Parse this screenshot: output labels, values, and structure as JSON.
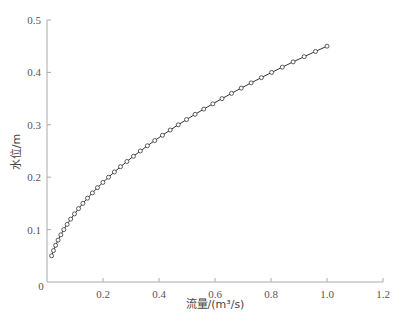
{
  "chart_data": {
    "type": "line",
    "title": "",
    "xlabel": "流量/(m³/s)",
    "ylabel": "水位/m",
    "xlim": [
      0,
      1.2
    ],
    "ylim": [
      0,
      0.5
    ],
    "x_ticks": [
      "0",
      "0.2",
      "0.4",
      "0.6",
      "0.8",
      "1.0",
      "1.2"
    ],
    "y_ticks": [
      "0.1",
      "0.2",
      "0.3",
      "0.4",
      "0.5"
    ],
    "grid": false,
    "legend": null,
    "series": [
      {
        "name": "水位-流量关系",
        "marker": "circle-open",
        "color": "#333333",
        "x": [
          0.0165,
          0.0231,
          0.0309,
          0.0396,
          0.0494,
          0.0601,
          0.0719,
          0.0846,
          0.0982,
          0.1127,
          0.1283,
          0.1448,
          0.1622,
          0.1803,
          0.1997,
          0.2196,
          0.2407,
          0.2624,
          0.2854,
          0.3088,
          0.3333,
          0.3585,
          0.3849,
          0.4123,
          0.44,
          0.4686,
          0.4982,
          0.5289,
          0.56,
          0.5922,
          0.625,
          0.659,
          0.6935,
          0.729,
          0.7657,
          0.8025,
          0.8403,
          0.879,
          0.9185,
          0.9589,
          1.0
        ],
        "y": [
          0.05,
          0.06,
          0.07,
          0.08,
          0.09,
          0.1,
          0.11,
          0.12,
          0.13,
          0.14,
          0.15,
          0.16,
          0.17,
          0.18,
          0.19,
          0.2,
          0.21,
          0.22,
          0.23,
          0.24,
          0.25,
          0.26,
          0.27,
          0.28,
          0.29,
          0.3,
          0.31,
          0.32,
          0.33,
          0.34,
          0.35,
          0.36,
          0.37,
          0.38,
          0.39,
          0.4,
          0.41,
          0.42,
          0.43,
          0.44,
          0.45
        ]
      }
    ]
  }
}
